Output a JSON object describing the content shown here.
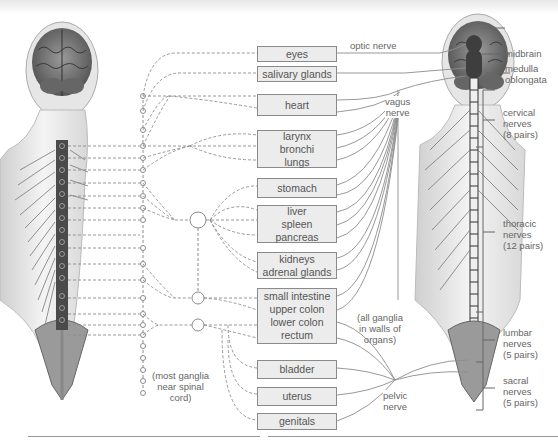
{
  "figure": {
    "organs": [
      {
        "id": "eyes",
        "lines": [
          "eyes"
        ]
      },
      {
        "id": "salivary",
        "lines": [
          "salivary glands"
        ]
      },
      {
        "id": "heart",
        "lines": [
          "heart"
        ]
      },
      {
        "id": "lungs",
        "lines": [
          "larynx",
          "bronchi",
          "lungs"
        ]
      },
      {
        "id": "stomach",
        "lines": [
          "stomach"
        ]
      },
      {
        "id": "liver",
        "lines": [
          "liver",
          "spleen",
          "pancreas"
        ]
      },
      {
        "id": "kidneys",
        "lines": [
          "kidneys",
          "adrenal glands"
        ]
      },
      {
        "id": "intestine",
        "lines": [
          "small intestine",
          "upper colon",
          "lower colon",
          "rectum"
        ]
      },
      {
        "id": "bladder",
        "lines": [
          "bladder"
        ]
      },
      {
        "id": "uterus",
        "lines": [
          "uterus"
        ]
      },
      {
        "id": "genitals",
        "lines": [
          "genitals"
        ]
      }
    ],
    "nerve_labels": {
      "optic": "optic nerve",
      "vagus": [
        "vagus",
        "nerve"
      ],
      "pelvic": [
        "pelvic",
        "nerve"
      ],
      "walls": [
        "(all ganglia",
        "in walls of",
        "organs)"
      ],
      "near_cord": [
        "(most ganglia",
        "near spinal",
        "cord)"
      ]
    },
    "brain_labels": {
      "midbrain": "midbrain",
      "medulla": [
        "medulla",
        "oblongata"
      ]
    },
    "spinal_regions": [
      {
        "id": "cervical",
        "lines": [
          "cervical",
          "nerves",
          "(8 pairs)"
        ]
      },
      {
        "id": "thoracic",
        "lines": [
          "thoracic",
          "nerves",
          "(12 pairs)"
        ]
      },
      {
        "id": "lumbar",
        "lines": [
          "lumbar",
          "nerves",
          "(5 pairs)"
        ]
      },
      {
        "id": "sacral",
        "lines": [
          "sacral",
          "nerves",
          "(5 pairs)"
        ]
      }
    ],
    "colors": {
      "box_fill": "#ececec",
      "box_border": "#8a8a8a",
      "line": "#8c8c8c",
      "cord_dark": "#4a4a4a",
      "text": "#555555"
    }
  }
}
